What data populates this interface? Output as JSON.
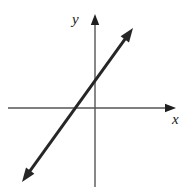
{
  "figure": {
    "width": 193,
    "height": 187,
    "background": "#ffffff"
  },
  "axes": {
    "x_label": "x",
    "y_label": "y",
    "axis_color": "#555555",
    "origin_px": {
      "x": 95,
      "y": 108
    },
    "x_axis": {
      "start_px": 8,
      "end_px": 176,
      "y_px": 108,
      "arrow": "right"
    },
    "y_axis": {
      "start_px": 14,
      "end_px": 187,
      "x_px": 95,
      "arrow": "up"
    }
  },
  "line": {
    "color": "#262626",
    "width_px": 3,
    "arrows": "both",
    "start_px": {
      "x": 22,
      "y": 182
    },
    "end_px": {
      "x": 133,
      "y": 28
    }
  },
  "chart_data": {
    "type": "line",
    "title": "",
    "xlabel": "x",
    "ylabel": "y",
    "grid": false,
    "legend": "none",
    "xlim": [
      -5,
      5
    ],
    "ylim": [
      -5,
      5
    ],
    "series": [
      {
        "name": "line",
        "equation": "y = 1.4x + 1.0",
        "slope": 1.4,
        "intercept": 1.0,
        "x": [
          -3.5,
          1.2
        ],
        "values": [
          -3.9,
          2.7
        ],
        "x_intercept": -0.72,
        "y_intercept": 1.0,
        "arrows": "both"
      }
    ]
  }
}
